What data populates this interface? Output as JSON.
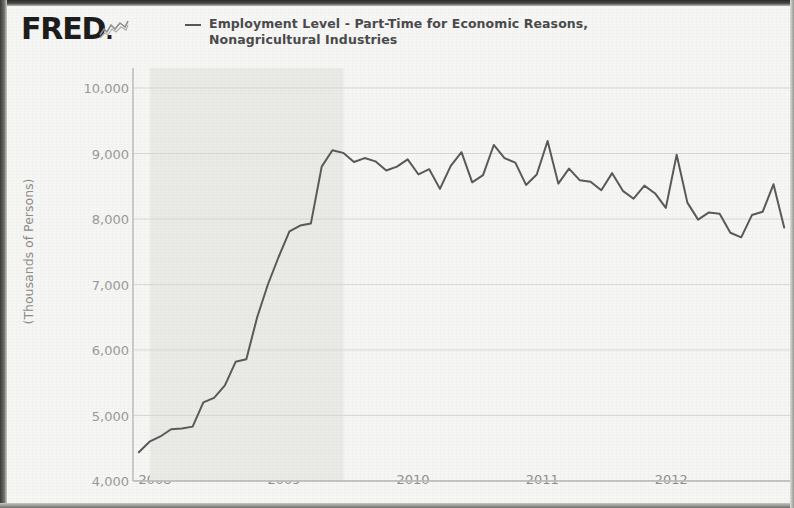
{
  "header": {
    "logo_text": "FRED",
    "logo_dot": ".",
    "logo_mark_name": "fred-squiggle-mark",
    "legend_line1": "Employment Level - Part-Time for Economic Reasons,",
    "legend_line2": "Nonagricultural Industries"
  },
  "colors": {
    "line": "#5a5a5c",
    "grid": "#d8d8d5",
    "axis": "#b9b9b6",
    "recession_band": "#eaeae7",
    "paper": "#f6f6f4",
    "tick_text": "#9a9a98",
    "legend_text": "#4b4b4d"
  },
  "chart_data": {
    "type": "line",
    "title": "",
    "subtitle": "",
    "xlabel": "",
    "ylabel": "(Thousands of Persons)",
    "ylim": [
      4000,
      10000
    ],
    "ytick_labels": [
      "10,000",
      "9,000",
      "8,000",
      "7,000",
      "6,000",
      "5,000",
      "4,000"
    ],
    "ytick_values": [
      10000,
      9000,
      8000,
      7000,
      6000,
      5000,
      4000
    ],
    "xlim": [
      2007.83,
      2012.92
    ],
    "xtick_labels": [
      "2008",
      "2009",
      "2010",
      "2011",
      "2012"
    ],
    "xtick_values": [
      2008,
      2009,
      2010,
      2011,
      2012
    ],
    "grid": true,
    "legend_position": "top",
    "shaded_regions": [
      {
        "name": "recession",
        "start": 2007.96,
        "end": 2009.46,
        "color": "#eaeae7"
      }
    ],
    "series": [
      {
        "name": "Employment Level - Part-Time for Economic Reasons, Nonagricultural Industries",
        "units": "Thousands of Persons",
        "frequency": "Monthly",
        "x": [
          2007.875,
          2007.958,
          2008.042,
          2008.125,
          2008.208,
          2008.292,
          2008.375,
          2008.458,
          2008.542,
          2008.625,
          2008.708,
          2008.792,
          2008.875,
          2008.958,
          2009.042,
          2009.125,
          2009.208,
          2009.292,
          2009.375,
          2009.458,
          2009.542,
          2009.625,
          2009.708,
          2009.792,
          2009.875,
          2009.958,
          2010.042,
          2010.125,
          2010.208,
          2010.292,
          2010.375,
          2010.458,
          2010.542,
          2010.625,
          2010.708,
          2010.792,
          2010.875,
          2010.958,
          2011.042,
          2011.125,
          2011.208,
          2011.292,
          2011.375,
          2011.458,
          2011.542,
          2011.625,
          2011.708,
          2011.792,
          2011.875,
          2011.958,
          2012.042,
          2012.125,
          2012.208,
          2012.292,
          2012.375,
          2012.458,
          2012.542,
          2012.625,
          2012.708,
          2012.792,
          2012.875
        ],
        "values": [
          4440,
          4600,
          4680,
          4790,
          4800,
          4830,
          5200,
          5270,
          5460,
          5820,
          5860,
          6500,
          7000,
          7420,
          7810,
          7900,
          7930,
          8800,
          9050,
          9010,
          8870,
          8930,
          8880,
          8740,
          8800,
          8910,
          8680,
          8760,
          8460,
          8810,
          9020,
          8560,
          8670,
          9130,
          8930,
          8860,
          8520,
          8680,
          9190,
          8540,
          8770,
          8590,
          8570,
          8440,
          8700,
          8430,
          8310,
          8510,
          8390,
          8170,
          8980,
          8250,
          7990,
          8100,
          8080,
          7790,
          7720,
          8060,
          8110,
          8530,
          7870
        ]
      }
    ]
  }
}
